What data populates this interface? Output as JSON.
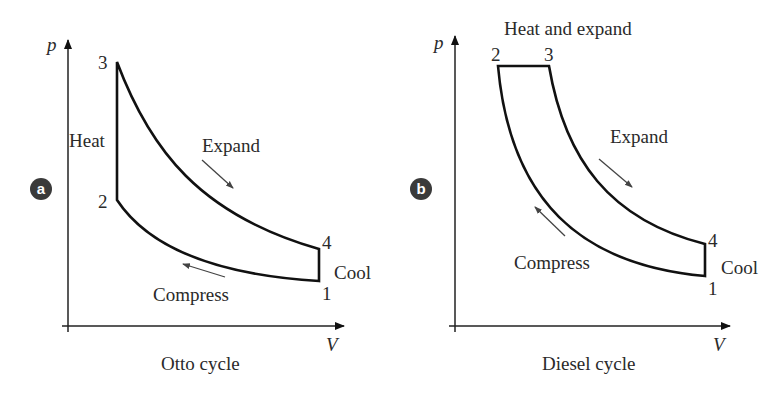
{
  "panels": [
    {
      "badge": "a",
      "title": "Otto cycle",
      "axis": {
        "y_label": "p",
        "x_label": "V"
      },
      "points": {
        "p1": "1",
        "p2": "2",
        "p3": "3",
        "p4": "4"
      },
      "labels": {
        "heat": "Heat",
        "expand": "Expand",
        "compress": "Compress",
        "cool": "Cool"
      }
    },
    {
      "badge": "b",
      "title": "Diesel cycle",
      "axis": {
        "y_label": "p",
        "x_label": "V"
      },
      "points": {
        "p1": "1",
        "p2": "2",
        "p3": "3",
        "p4": "4"
      },
      "labels": {
        "heat": "Heat and expand",
        "expand": "Expand",
        "compress": "Compress",
        "cool": "Cool"
      }
    }
  ],
  "colors": {
    "line": "#111111",
    "arrow": "#444444",
    "badge": "#3a3a3a",
    "text": "#2a2a2a"
  }
}
